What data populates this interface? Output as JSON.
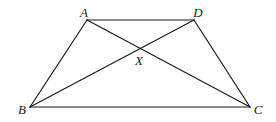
{
  "figure": {
    "type": "trapezium with diagonals",
    "stroke_color": "#1a1a1a",
    "background": "#ffffff"
  },
  "points": {
    "A": {
      "label": "A",
      "x": 87,
      "y": 20,
      "label_x": 84,
      "label_y": 12
    },
    "D": {
      "label": "D",
      "x": 194,
      "y": 20,
      "label_x": 198,
      "label_y": 12
    },
    "B": {
      "label": "B",
      "x": 30,
      "y": 107,
      "label_x": 22,
      "label_y": 109
    },
    "C": {
      "label": "C",
      "x": 250,
      "y": 107,
      "label_x": 258,
      "label_y": 109
    },
    "X": {
      "label": "X",
      "x": 140,
      "y": 48,
      "label_x": 139,
      "label_y": 60
    }
  },
  "segments": [
    {
      "name": "AD",
      "from": "A",
      "to": "D"
    },
    {
      "name": "AB",
      "from": "A",
      "to": "B"
    },
    {
      "name": "DC",
      "from": "D",
      "to": "C"
    },
    {
      "name": "BC",
      "from": "B",
      "to": "C"
    },
    {
      "name": "AC",
      "from": "A",
      "to": "C"
    },
    {
      "name": "BD",
      "from": "B",
      "to": "D"
    }
  ]
}
